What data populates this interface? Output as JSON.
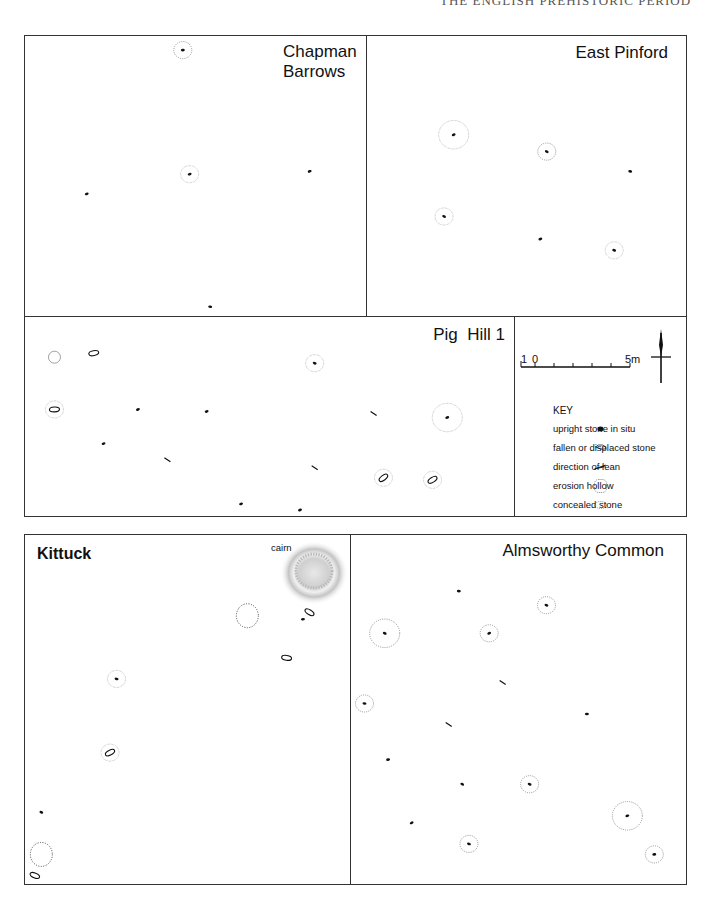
{
  "page": {
    "running_header": "THE ENGLISH PREHISTORIC PERIOD"
  },
  "sites": {
    "chapman_barrows": {
      "title_line1": "Chapman",
      "title_line2": "Barrows",
      "stones": [
        {
          "type": "upright",
          "x": 0.46,
          "y": 0.05,
          "hollow": "concealed"
        },
        {
          "type": "upright",
          "x": 0.48,
          "y": 0.49,
          "hollow": "erosion"
        },
        {
          "type": "upright",
          "x": 0.83,
          "y": 0.48
        },
        {
          "type": "upright",
          "x": 0.18,
          "y": 0.56
        },
        {
          "type": "upright",
          "x": 0.54,
          "y": 0.96
        }
      ]
    },
    "east_pinford": {
      "title": "East Pinford",
      "stones": [
        {
          "type": "upright",
          "x": 0.27,
          "y": 0.35,
          "hollow": "erosion-large"
        },
        {
          "type": "upright",
          "x": 0.56,
          "y": 0.41,
          "hollow": "concealed"
        },
        {
          "type": "upright",
          "x": 0.82,
          "y": 0.48
        },
        {
          "type": "upright",
          "x": 0.24,
          "y": 0.64,
          "hollow": "erosion"
        },
        {
          "type": "upright",
          "x": 0.54,
          "y": 0.72
        },
        {
          "type": "upright",
          "x": 0.77,
          "y": 0.76,
          "hollow": "erosion"
        }
      ]
    },
    "pig_hill_1": {
      "title": "Pig  Hill 1",
      "stones": [
        {
          "type": "hollow-only",
          "x": 0.06,
          "y": 0.2
        },
        {
          "type": "fallen",
          "x": 0.14,
          "y": 0.18
        },
        {
          "type": "upright",
          "x": 0.59,
          "y": 0.23,
          "hollow": "erosion"
        },
        {
          "type": "fallen",
          "x": 0.06,
          "y": 0.46,
          "hollow": "erosion"
        },
        {
          "type": "upright",
          "x": 0.23,
          "y": 0.46
        },
        {
          "type": "upright",
          "x": 0.37,
          "y": 0.47
        },
        {
          "type": "lean",
          "x": 0.71,
          "y": 0.48
        },
        {
          "type": "upright",
          "x": 0.86,
          "y": 0.5,
          "hollow": "erosion-large"
        },
        {
          "type": "upright",
          "x": 0.16,
          "y": 0.63
        },
        {
          "type": "lean",
          "x": 0.29,
          "y": 0.71
        },
        {
          "type": "lean",
          "x": 0.59,
          "y": 0.75
        },
        {
          "type": "fallen",
          "x": 0.73,
          "y": 0.8,
          "hollow": "erosion"
        },
        {
          "type": "fallen",
          "x": 0.83,
          "y": 0.81,
          "hollow": "erosion"
        },
        {
          "type": "upright",
          "x": 0.44,
          "y": 0.93
        },
        {
          "type": "upright",
          "x": 0.56,
          "y": 0.96
        }
      ]
    },
    "kittuck": {
      "title": "Kittuck",
      "cairn_label": "cairn",
      "stones": [
        {
          "type": "hollow-only-concealed",
          "x": 0.68,
          "y": 0.23
        },
        {
          "type": "fallen",
          "x": 0.87,
          "y": 0.22
        },
        {
          "type": "upright",
          "x": 0.85,
          "y": 0.24
        },
        {
          "type": "fallen",
          "x": 0.8,
          "y": 0.35
        },
        {
          "type": "upright",
          "x": 0.28,
          "y": 0.41,
          "hollow": "erosion"
        },
        {
          "type": "fallen",
          "x": 0.26,
          "y": 0.62,
          "hollow": "erosion"
        },
        {
          "type": "upright",
          "x": 0.05,
          "y": 0.79
        },
        {
          "type": "hollow-only-concealed",
          "x": 0.05,
          "y": 0.91
        },
        {
          "type": "fallen",
          "x": 0.03,
          "y": 0.97
        }
      ]
    },
    "almsworthy_common": {
      "title": "Almsworthy Common",
      "stones": [
        {
          "type": "upright",
          "x": 0.32,
          "y": 0.16
        },
        {
          "type": "upright",
          "x": 0.58,
          "y": 0.2,
          "hollow": "concealed"
        },
        {
          "type": "upright",
          "x": 0.1,
          "y": 0.28,
          "hollow": "concealed-large"
        },
        {
          "type": "upright",
          "x": 0.41,
          "y": 0.28,
          "hollow": "concealed"
        },
        {
          "type": "lean",
          "x": 0.45,
          "y": 0.42
        },
        {
          "type": "upright",
          "x": 0.04,
          "y": 0.48,
          "hollow": "concealed"
        },
        {
          "type": "upright",
          "x": 0.7,
          "y": 0.51
        },
        {
          "type": "lean",
          "x": 0.29,
          "y": 0.54
        },
        {
          "type": "upright",
          "x": 0.11,
          "y": 0.64
        },
        {
          "type": "upright",
          "x": 0.33,
          "y": 0.71
        },
        {
          "type": "upright",
          "x": 0.53,
          "y": 0.71,
          "hollow": "concealed"
        },
        {
          "type": "upright",
          "x": 0.82,
          "y": 0.8,
          "hollow": "concealed-large"
        },
        {
          "type": "upright",
          "x": 0.18,
          "y": 0.82
        },
        {
          "type": "upright",
          "x": 0.35,
          "y": 0.88,
          "hollow": "concealed"
        },
        {
          "type": "upright",
          "x": 0.9,
          "y": 0.91,
          "hollow": "concealed"
        }
      ]
    }
  },
  "scale_bar": {
    "left_label": "1",
    "zero_label": "0",
    "right_label": "5m",
    "subdivisions": 5
  },
  "north_arrow": {
    "icon": "north-arrow-icon"
  },
  "key": {
    "title": "KEY",
    "items": [
      {
        "symbol": "upright-stone-icon",
        "label": "upright stone in situ"
      },
      {
        "symbol": "fallen-stone-icon",
        "label": "fallen or displaced stone"
      },
      {
        "symbol": "lean-direction-icon",
        "label": "direction of lean"
      },
      {
        "symbol": "erosion-hollow-icon",
        "label": "erosion hollow"
      },
      {
        "symbol": "concealed-stone-icon",
        "label": "concealed stone"
      }
    ]
  }
}
